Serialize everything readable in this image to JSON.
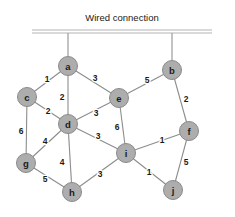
{
  "figure": {
    "width": 235,
    "height": 217,
    "background_color": "#ffffff"
  },
  "bus": {
    "label": "Wired connection",
    "label_x": 122,
    "label_y": 17,
    "line_color": "#b4b4b4",
    "x_start": 32,
    "x_end": 212,
    "y_top": 30,
    "y_bottom": 33
  },
  "style": {
    "node_fill": "#adadad",
    "node_stroke": "#8a8a8a",
    "node_radius": 9.5,
    "edge_color": "#8c8c8c",
    "label_color": "#1c1c1c",
    "weight_color": "#1a1a1a"
  },
  "chart_data": {
    "type": "diagram",
    "title": "Wired connection",
    "graph_kind": "weighted-undirected-network",
    "nodes": [
      {
        "id": "a",
        "label": "a",
        "x": 68,
        "y": 66
      },
      {
        "id": "b",
        "label": "b",
        "x": 172,
        "y": 70
      },
      {
        "id": "c",
        "label": "c",
        "x": 27,
        "y": 97
      },
      {
        "id": "d",
        "label": "d",
        "x": 68,
        "y": 124
      },
      {
        "id": "e",
        "label": "e",
        "x": 119,
        "y": 98
      },
      {
        "id": "f",
        "label": "f",
        "x": 189,
        "y": 131
      },
      {
        "id": "g",
        "label": "g",
        "x": 26,
        "y": 163
      },
      {
        "id": "h",
        "label": "h",
        "x": 72,
        "y": 192
      },
      {
        "id": "i",
        "label": "i",
        "x": 126,
        "y": 153
      },
      {
        "id": "j",
        "label": "j",
        "x": 173,
        "y": 190
      }
    ],
    "edges": [
      {
        "source": "a",
        "target": "c",
        "weight": 1,
        "label_x": 47,
        "label_y": 79
      },
      {
        "source": "a",
        "target": "d",
        "weight": 2,
        "label_x": 62,
        "label_y": 97
      },
      {
        "source": "a",
        "target": "e",
        "weight": 3,
        "label_x": 95,
        "label_y": 78
      },
      {
        "source": "b",
        "target": "e",
        "weight": 5,
        "label_x": 147,
        "label_y": 80
      },
      {
        "source": "b",
        "target": "f",
        "weight": 2,
        "label_x": 186,
        "label_y": 99
      },
      {
        "source": "c",
        "target": "d",
        "weight": 2,
        "label_x": 48,
        "label_y": 111
      },
      {
        "source": "c",
        "target": "g",
        "weight": 6,
        "label_x": 21,
        "label_y": 131
      },
      {
        "source": "d",
        "target": "e",
        "weight": 3,
        "label_x": 96,
        "label_y": 113
      },
      {
        "source": "d",
        "target": "g",
        "weight": 4,
        "label_x": 45,
        "label_y": 141
      },
      {
        "source": "d",
        "target": "h",
        "weight": 4,
        "label_x": 62,
        "label_y": 162
      },
      {
        "source": "d",
        "target": "i",
        "weight": 3,
        "label_x": 98,
        "label_y": 136
      },
      {
        "source": "e",
        "target": "i",
        "weight": 6,
        "label_x": 117,
        "label_y": 127
      },
      {
        "source": "f",
        "target": "i",
        "weight": 1,
        "label_x": 162,
        "label_y": 140
      },
      {
        "source": "f",
        "target": "j",
        "weight": 5,
        "label_x": 186,
        "label_y": 162
      },
      {
        "source": "g",
        "target": "h",
        "weight": 5,
        "label_x": 45,
        "label_y": 179
      },
      {
        "source": "h",
        "target": "i",
        "weight": 3,
        "label_x": 100,
        "label_y": 174
      },
      {
        "source": "i",
        "target": "j",
        "weight": 1,
        "label_x": 149,
        "label_y": 172
      }
    ],
    "uplinks": [
      {
        "node": "a",
        "from_y": 33,
        "to_y": 56
      },
      {
        "node": "b",
        "from_y": 33,
        "to_y": 60
      }
    ]
  }
}
